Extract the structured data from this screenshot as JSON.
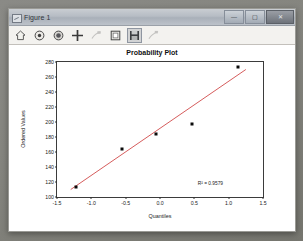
{
  "window": {
    "title": "Figure 1",
    "icon": "figure-window-icon",
    "controls": [
      {
        "name": "minimize-button",
        "glyph": "—"
      },
      {
        "name": "maximize-button",
        "glyph": "▢"
      },
      {
        "name": "close-button",
        "glyph": "✕"
      }
    ]
  },
  "toolbar": {
    "buttons": [
      {
        "name": "home-button",
        "icon": "home-icon",
        "state": "enabled"
      },
      {
        "name": "back-button",
        "icon": "back-arrow-icon",
        "state": "enabled"
      },
      {
        "name": "forward-button",
        "icon": "forward-arrow-icon",
        "state": "enabled"
      },
      {
        "name": "pan-button",
        "icon": "pan-move-icon",
        "state": "enabled"
      },
      {
        "name": "zoom-button",
        "icon": "zoom-rect-icon",
        "state": "disabled"
      },
      {
        "name": "configure-subplots-button",
        "icon": "subplots-icon",
        "state": "enabled"
      },
      {
        "name": "save-button",
        "icon": "save-disk-icon",
        "state": "active"
      },
      {
        "name": "edit-axis-button",
        "icon": "edit-curve-icon",
        "state": "disabled"
      }
    ]
  },
  "chart_data": {
    "type": "scatter",
    "title": "Probability Plot",
    "xlabel": "Quantiles",
    "ylabel": "Ordered Values",
    "xlim": [
      -1.5,
      1.5
    ],
    "ylim": [
      100,
      280
    ],
    "xticks": [
      "-1.5",
      "-1.0",
      "-0.5",
      "0.0",
      "0.5",
      "1.0",
      "1.5"
    ],
    "xtick_values": [
      -1.5,
      -1.0,
      -0.5,
      0.0,
      0.5,
      1.0,
      1.5
    ],
    "yticks": [
      "100",
      "120",
      "140",
      "160",
      "180",
      "200",
      "220",
      "240",
      "260",
      "280"
    ],
    "ytick_values": [
      100,
      120,
      140,
      160,
      180,
      200,
      220,
      240,
      260,
      280
    ],
    "grid": false,
    "legend": null,
    "marker_color": "#0b0b0b",
    "line_color": "#d04a4a",
    "points": [
      {
        "x": -1.23,
        "y": 114
      },
      {
        "x": -0.56,
        "y": 164
      },
      {
        "x": -0.06,
        "y": 184
      },
      {
        "x": 0.46,
        "y": 197
      },
      {
        "x": 1.14,
        "y": 274
      }
    ],
    "fit_line": {
      "x": [
        -1.3,
        1.25
      ],
      "y": [
        110,
        270
      ]
    },
    "annotation": {
      "text": "R² = 0.9579",
      "x": 0.55,
      "y": 122
    }
  }
}
